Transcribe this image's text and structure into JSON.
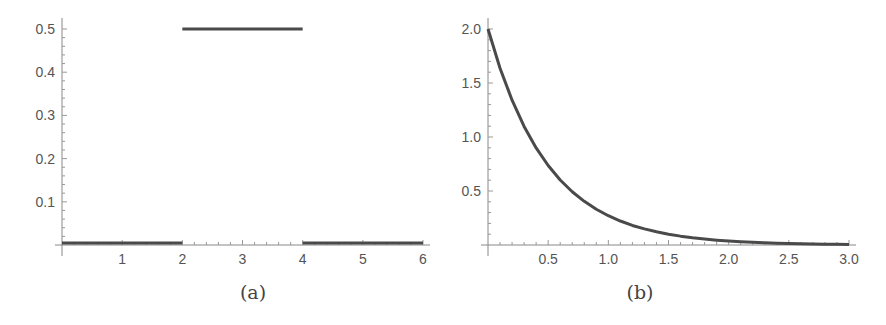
{
  "chart_data": [
    {
      "type": "line",
      "panel": "a",
      "caption": "(a)",
      "title": "",
      "xlabel": "",
      "ylabel": "",
      "xlim": [
        0,
        6
      ],
      "ylim": [
        0,
        0.5
      ],
      "x_ticks": [
        1,
        2,
        3,
        4,
        5,
        6
      ],
      "x_tick_labels": [
        "1",
        "2",
        "3",
        "4",
        "5",
        "6"
      ],
      "y_ticks": [
        0.1,
        0.2,
        0.3,
        0.4,
        0.5
      ],
      "y_tick_labels": [
        "0.1",
        "0.2",
        "0.3",
        "0.4",
        "0.5"
      ],
      "x_minor_step": 0.2,
      "y_minor_step": 0.02,
      "grid": false,
      "series": [
        {
          "name": "piecewise uniform density",
          "segments": [
            {
              "x": [
                0,
                2
              ],
              "y": [
                0,
                0
              ]
            },
            {
              "x": [
                2,
                4
              ],
              "y": [
                0.5,
                0.5
              ]
            },
            {
              "x": [
                4,
                6
              ],
              "y": [
                0,
                0
              ]
            }
          ],
          "color": "#4a4a4a"
        }
      ]
    },
    {
      "type": "line",
      "panel": "b",
      "caption": "(b)",
      "title": "",
      "xlabel": "",
      "ylabel": "",
      "xlim": [
        0,
        3
      ],
      "ylim": [
        0,
        2
      ],
      "x_ticks": [
        0.5,
        1.0,
        1.5,
        2.0,
        2.5,
        3.0
      ],
      "x_tick_labels": [
        "0.5",
        "1.0",
        "1.5",
        "2.0",
        "2.5",
        "3.0"
      ],
      "y_ticks": [
        0.5,
        1.0,
        1.5,
        2.0
      ],
      "y_tick_labels": [
        "0.5",
        "1.0",
        "1.5",
        "2.0"
      ],
      "x_minor_step": 0.1,
      "y_minor_step": 0.1,
      "grid": false,
      "series": [
        {
          "name": "exponential density 2e^(-2x)",
          "x": [
            0,
            0.1,
            0.2,
            0.3,
            0.4,
            0.5,
            0.6,
            0.7,
            0.8,
            0.9,
            1.0,
            1.1,
            1.2,
            1.3,
            1.4,
            1.5,
            1.6,
            1.7,
            1.8,
            1.9,
            2.0,
            2.1,
            2.2,
            2.3,
            2.4,
            2.5,
            2.6,
            2.7,
            2.8,
            2.9,
            3.0
          ],
          "y": [
            2.0,
            1.637,
            1.341,
            1.098,
            0.899,
            0.736,
            0.602,
            0.493,
            0.404,
            0.331,
            0.271,
            0.222,
            0.181,
            0.149,
            0.122,
            0.1,
            0.082,
            0.067,
            0.055,
            0.045,
            0.037,
            0.03,
            0.025,
            0.02,
            0.016,
            0.013,
            0.011,
            0.009,
            0.007,
            0.006,
            0.005
          ],
          "color": "#4a4a4a"
        }
      ]
    }
  ]
}
